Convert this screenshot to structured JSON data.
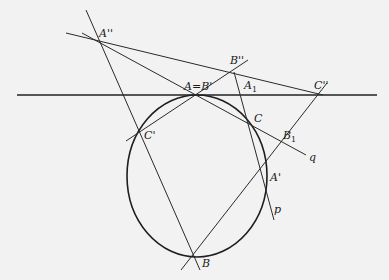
{
  "diagram": {
    "type": "projective geometry construction (Pascal line on a conic)",
    "conic": {
      "shape": "ellipse",
      "cx": 197,
      "cy": 176,
      "rx": 70,
      "ry": 81
    },
    "points": {
      "A_double_prime": {
        "label": "A''",
        "x": 100,
        "y": 38
      },
      "B_double_prime": {
        "label": "B''",
        "x": 234,
        "y": 72
      },
      "C_double_prime": {
        "label": "C''",
        "x": 320,
        "y": 93
      },
      "A_eq_B_prime": {
        "label": "A=B'",
        "x": 197,
        "y": 95
      },
      "A1": {
        "label": "A",
        "sub": "1",
        "x": 243,
        "y": 95
      },
      "C": {
        "label": "C",
        "x": 252,
        "y": 124
      },
      "C_prime": {
        "label": "C'",
        "x": 140,
        "y": 131
      },
      "B1": {
        "label": "B",
        "sub": "1",
        "x": 281,
        "y": 143
      },
      "A_prime": {
        "label": "A'",
        "x": 268,
        "y": 176
      },
      "B": {
        "label": "B",
        "x": 195,
        "y": 256
      }
    },
    "line_labels": {
      "q": "q",
      "p": "p"
    },
    "lines": [
      {
        "name": "tangent-horizontal",
        "x1": 17,
        "y1": 95,
        "x2": 377,
        "y2": 95,
        "thick": true
      },
      {
        "name": "line-App-B",
        "x1": 86,
        "y1": 10,
        "x2": 200,
        "y2": 270
      },
      {
        "name": "line-App-Cpp",
        "x1": 66,
        "y1": 33,
        "x2": 323,
        "y2": 95
      },
      {
        "name": "line-App-AB-q",
        "x1": 82,
        "y1": 33,
        "x2": 306,
        "y2": 155
      },
      {
        "name": "line-Cp-Bpp",
        "x1": 126,
        "y1": 141,
        "x2": 248,
        "y2": 60
      },
      {
        "name": "line-Bpp-p",
        "x1": 234,
        "y1": 72,
        "x2": 274,
        "y2": 220
      },
      {
        "name": "line-B-Cpp",
        "x1": 181,
        "y1": 270,
        "x2": 327,
        "y2": 83
      }
    ]
  }
}
